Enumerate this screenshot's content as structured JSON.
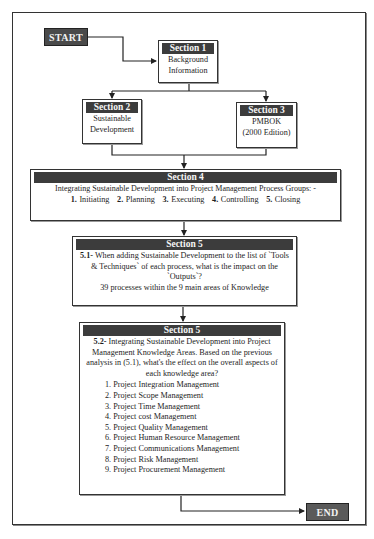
{
  "flowchart": {
    "start": {
      "label": "START"
    },
    "end": {
      "label": "END"
    },
    "section1": {
      "header": "Section 1",
      "lines": [
        "Background",
        "Information"
      ]
    },
    "section2": {
      "header": "Section 2",
      "lines": [
        "Sustainable",
        "Development"
      ]
    },
    "section3": {
      "header": "Section 3",
      "lines": [
        "PMBOK",
        "(2000 Edition)"
      ]
    },
    "section4": {
      "header": "Section 4",
      "intro": "Integrating Sustainable Development into Project Management Process Groups: -",
      "groups": [
        {
          "num": "1.",
          "label": "Initiating"
        },
        {
          "num": "2.",
          "label": "Planning"
        },
        {
          "num": "3.",
          "label": "Executing"
        },
        {
          "num": "4.",
          "label": "Controlling"
        },
        {
          "num": "5.",
          "label": "Closing"
        }
      ]
    },
    "section5_1": {
      "header": "Section 5",
      "num": "5.1-",
      "text": "When adding Sustainable Development to the list of `Tools & Techniques` of each process, what is the impact on the `Outputs`?",
      "note": "39 processes within the 9 main areas of Knowledge"
    },
    "section5_2": {
      "header": "Section 5",
      "num": "5.2-",
      "text": "Integrating Sustainable Development into Project Management Knowledge Areas. Based on the previous analysis in (5.1), what's the effect on the overall aspects of each knowledge area?",
      "areas": [
        "1. Project Integration Management",
        "2. Project Scope Management",
        "3. Project Time Management",
        "4. Project cost Management",
        "5. Project Quality Management",
        "6. Project Human Resource Management",
        "7. Project Communications Management",
        "8. Project Risk Management",
        "9. Project Procurement Management"
      ]
    }
  },
  "colors": {
    "header_fill": "#3c3c3c",
    "terminal_fill": "#4a4a4a",
    "line": "#222222"
  }
}
